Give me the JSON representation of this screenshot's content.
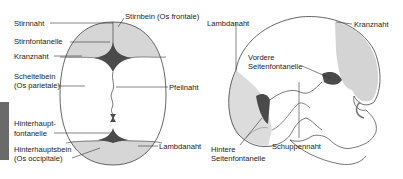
{
  "figure": {
    "top_view": {
      "labels": {
        "stirnnaht": "Stirnnaht",
        "stirnbein": "Stirnbein (Os frontale)",
        "stirnfontanelle": "Stirnfontanelle",
        "kranznaht": "Kranznaht",
        "scheitelbein_1": "Scheitelbein",
        "scheitelbein_2": "(Os parietale)",
        "pfeilnaht": "Pfeilnaht",
        "hinterhauptfontanelle_1": "Hinterhaupt-",
        "hinterhauptfontanelle_2": "fontanelle",
        "hinterhauptsbein_1": "Hinterhauptsbein",
        "hinterhauptsbein_2": "(Os occipitale)",
        "lambdanaht": "Lambdanaht"
      }
    },
    "side_view": {
      "labels": {
        "lambdanaht": "Lambdanaht",
        "kranznaht": "Kranznaht",
        "vordere_1": "Vordere",
        "vordere_2": "Seitenfontanelle",
        "hintere_1": "Hintere",
        "hintere_2": "Seitenfontanelle",
        "schuppennaht": "Schuppennaht"
      }
    },
    "colors": {
      "bone_shade": "#d4d4d4",
      "fontanelle_dark": "#4a4a4a",
      "outline": "#555555",
      "side_bar": "#6a6a6a"
    }
  }
}
